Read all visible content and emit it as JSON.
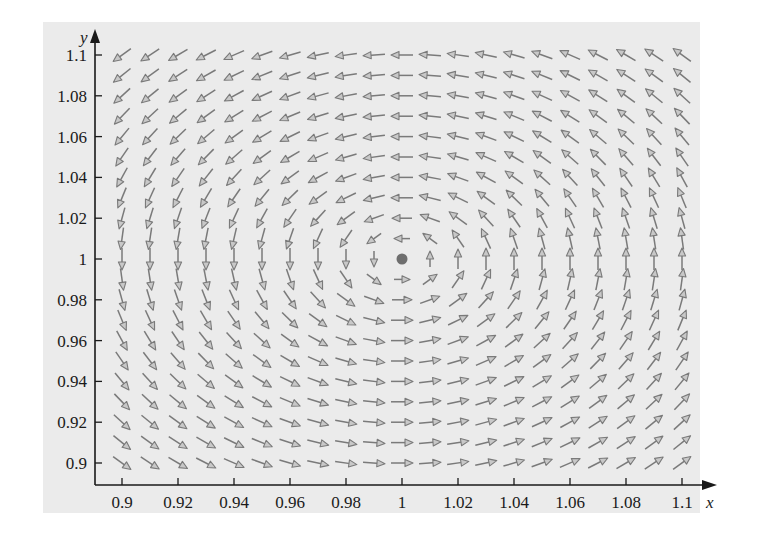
{
  "chart_data": {
    "type": "vector_field",
    "title": "",
    "xlabel": "x",
    "ylabel": "y",
    "xlim": [
      0.89,
      1.115
    ],
    "ylim": [
      0.89,
      1.11
    ],
    "grid": false,
    "legend": null,
    "x_ticks": [
      0.9,
      0.92,
      0.94,
      0.96,
      0.98,
      1,
      1.02,
      1.04,
      1.06,
      1.08,
      1.1
    ],
    "x_tick_labels": [
      "0.9",
      "0.92",
      "0.94",
      "0.96",
      "0.98",
      "1",
      "1.02",
      "1.04",
      "1.06",
      "1.08",
      "1.1"
    ],
    "y_ticks": [
      0.9,
      0.92,
      0.94,
      0.96,
      0.98,
      1,
      1.02,
      1.04,
      1.06,
      1.08,
      1.1
    ],
    "y_tick_labels": [
      "0.9",
      "0.92",
      "0.94",
      "0.96",
      "0.98",
      "1",
      "1.02",
      "1.04",
      "1.06",
      "1.08",
      "1.1"
    ],
    "field": {
      "description": "Normalized direction field circulating counterclockwise around equilibrium point",
      "dx_dt": "-(y - 1)",
      "dy_dt": "(x - 1)",
      "grid_x": {
        "start": 0.9,
        "end": 1.1,
        "step": 0.01
      },
      "grid_y": {
        "start": 0.9,
        "end": 1.1,
        "step": 0.01
      },
      "arrow_length_px": 22,
      "normalized": true
    },
    "equilibrium_point": {
      "x": 1,
      "y": 1,
      "label": ""
    },
    "colors": {
      "background_panel": "#ebebeb",
      "arrow": "#7a7a7a",
      "arrowhead_fill": "#c8c8c8",
      "equilibrium_point": "#6e6e6e",
      "axis": "#1a1a1a"
    }
  },
  "layout_px": {
    "x_axis_y": 485,
    "y_axis_x": 95,
    "x0_value": 0.9,
    "x0_px": 122,
    "px_per_unit_x": 2800,
    "y0_value": 0.9,
    "y0_px": 463,
    "px_per_unit_y": 2040
  }
}
